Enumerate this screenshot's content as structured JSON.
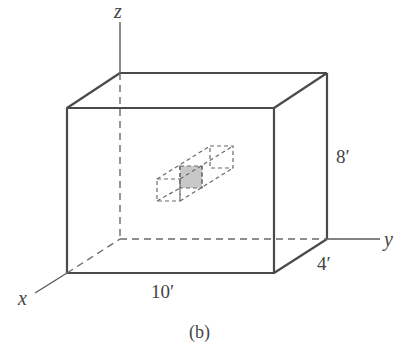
{
  "figure": {
    "caption": "(b)",
    "axes": {
      "x": "x",
      "y": "y",
      "z": "z"
    },
    "dimensions": {
      "width": "10′",
      "depth": "4′",
      "height": "8′"
    },
    "colors": {
      "line": "#4a4a4a",
      "dashed": "#6a6a6a",
      "shaded": "#c8c8c8"
    }
  }
}
